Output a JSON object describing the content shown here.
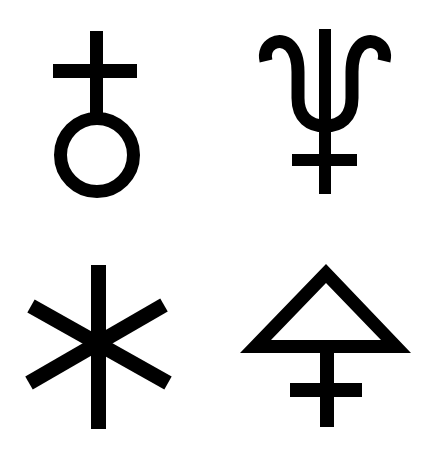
{
  "title": "Alchemical / astronomical symbols",
  "colors": {
    "background": "#ffffff",
    "ink": "#000000"
  },
  "symbols": [
    {
      "name": "Uranus (orb with cross)",
      "icon": "uranus-icon",
      "position": "top-left"
    },
    {
      "name": "Neptune (trident)",
      "icon": "neptune-icon",
      "position": "top-right"
    },
    {
      "name": "Six-armed asterisk",
      "icon": "asterisk-icon",
      "position": "bottom-left"
    },
    {
      "name": "Sulfur (triangle over double cross)",
      "icon": "sulfur-icon",
      "position": "bottom-right"
    }
  ]
}
